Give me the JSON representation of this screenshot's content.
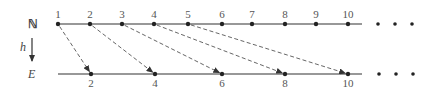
{
  "top_row": {
    "set_label": "ℕ",
    "line_start": 58,
    "line_end": 362,
    "y": 24,
    "points": [
      {
        "label": "1",
        "x": 58
      },
      {
        "label": "2",
        "x": 90
      },
      {
        "label": "3",
        "x": 122
      },
      {
        "label": "4",
        "x": 154
      },
      {
        "label": "5",
        "x": 188
      },
      {
        "label": "6",
        "x": 222
      },
      {
        "label": "7",
        "x": 252
      },
      {
        "label": "8",
        "x": 285
      },
      {
        "label": "9",
        "x": 316
      },
      {
        "label": "10",
        "x": 348
      }
    ],
    "ellipsis_x": [
      378,
      395,
      412
    ]
  },
  "bottom_row": {
    "set_label": "E",
    "line_start": 58,
    "line_end": 362,
    "y": 74,
    "points": [
      {
        "label": "2",
        "x": 91
      },
      {
        "label": "4",
        "x": 155
      },
      {
        "label": "6",
        "x": 222
      },
      {
        "label": "8",
        "x": 285
      },
      {
        "label": "10",
        "x": 348
      }
    ],
    "ellipsis_x": [
      379,
      396,
      413
    ]
  },
  "map_label": "h",
  "mappings": [
    {
      "from": 0,
      "to": 0
    },
    {
      "from": 1,
      "to": 1
    },
    {
      "from": 2,
      "to": 2
    },
    {
      "from": 3,
      "to": 3
    },
    {
      "from": 4,
      "to": 4
    }
  ],
  "colors": {
    "line": "#333333",
    "dash": "#555555",
    "dot": "#222222"
  }
}
